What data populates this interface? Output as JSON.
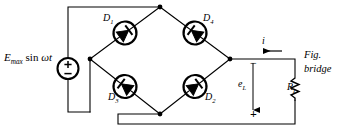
{
  "figure": {
    "background_color": "#ffffff",
    "line_color": "#000000",
    "caption_line1": "Fig.",
    "caption_line2": "bridge"
  },
  "source": {
    "label_main": "E",
    "label_sub": "max",
    "label_rest": "sin",
    "label_omega_t": "ωt",
    "full_text": "Emax sin ωt",
    "symbol": "ac-voltage-source",
    "terminal_top": "+",
    "terminal_bottom": "−"
  },
  "bridge": {
    "name": "diode-bridge",
    "diodes": [
      {
        "id": "D1",
        "label": "D",
        "sub": "1",
        "position": "upper-left",
        "direction": "toward-top-node"
      },
      {
        "id": "D4",
        "label": "D",
        "sub": "4",
        "position": "upper-right",
        "direction": "toward-top-node"
      },
      {
        "id": "D3",
        "label": "D",
        "sub": "3",
        "position": "lower-left",
        "direction": "toward-left-node"
      },
      {
        "id": "D2",
        "label": "D",
        "sub": "2",
        "position": "lower-right",
        "direction": "toward-right-node"
      }
    ],
    "nodes": [
      "top",
      "left",
      "right",
      "bottom"
    ]
  },
  "load": {
    "resistor_label": "R",
    "resistor_sub": "L",
    "voltage_label": "e",
    "voltage_sub": "L",
    "voltage_polarity_top": "−",
    "voltage_polarity_bottom": "+",
    "current_label": "i",
    "current_direction": "leftward"
  }
}
